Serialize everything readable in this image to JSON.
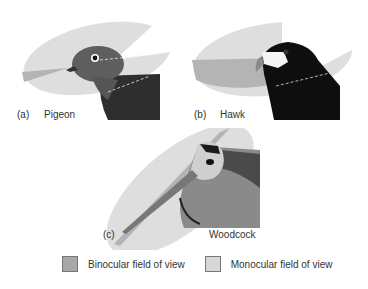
{
  "figure": {
    "panels": [
      {
        "id": "a",
        "marker": "(a)",
        "name": "Pigeon"
      },
      {
        "id": "b",
        "marker": "(b)",
        "name": "Hawk"
      },
      {
        "id": "c",
        "marker": "(c)",
        "name": "Woodcock"
      }
    ],
    "legend": [
      {
        "label": "Binocular field of view",
        "color": "#a8a8a8"
      },
      {
        "label": "Monocular field of view",
        "color": "#d6d6d6"
      }
    ]
  },
  "colors": {
    "monocular": "#dedede",
    "binocular": "#b4b4b4",
    "pigeon_head": "#5e5e5e",
    "pigeon_body": "#2e2e2e",
    "hawk_body": "#0e0e0e",
    "woodcock_mid": "#8a8a8a"
  }
}
